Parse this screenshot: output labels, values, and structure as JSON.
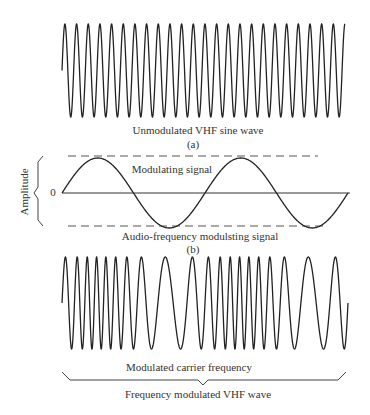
{
  "panel_a": {
    "caption": "Unmodulated VHF sine wave",
    "label": "(a)",
    "wave": {
      "x_start": 62,
      "x_end": 345,
      "y_top": 24,
      "y_bottom": 117,
      "cycles": 24.25
    }
  },
  "panel_b": {
    "signal_label": "Modulating signal",
    "caption": "Audio-frequency  modulsting signal",
    "label": "(b)",
    "axis_label": "Amplitude",
    "zero_label": "0",
    "wave": {
      "x_start": 62,
      "x_end": 348,
      "y_zero": 193,
      "amplitude": 35,
      "cycles": 2.0
    },
    "dashed_top_y": 156,
    "dashed_bottom_y": 226
  },
  "panel_c": {
    "inner_caption": "Modulated carrier frequency",
    "caption": "Frequency   modulated VHF wave",
    "wave": {
      "x_start": 62,
      "x_end": 348,
      "y_top": 257,
      "y_bottom": 349,
      "carrier_cycles": 20,
      "deviation": 0.55,
      "mod_cycles": 2.0
    }
  },
  "colors": {
    "ink": "#222222",
    "dash": "#555555",
    "text": "#333333"
  }
}
